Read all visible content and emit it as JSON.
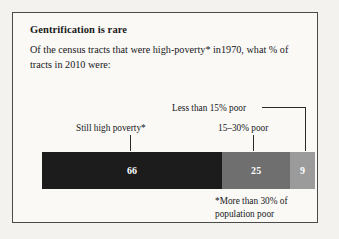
{
  "figure": {
    "title": "Gentrification is rare",
    "subtitle": "Of the census tracts that were high-poverty* in1970, what % of tracts in 2010 were:",
    "footnote": "*More than 30% of population poor",
    "labels": {
      "less_than_15": "Less than 15% poor",
      "fifteen_to_30": "15–30% poor",
      "still_high_poverty": "Still high poverty*"
    },
    "colors": {
      "background": "#f3f2ee",
      "panel": "#faf9f6",
      "border": "#4a4a48",
      "high_poverty": "#1c1c1c",
      "mid_poverty": "#6f6f6f",
      "low_poverty": "#9b9b9b",
      "value_text": "#ffffff",
      "leader_line": "#2a2a2a"
    }
  },
  "chart_data": {
    "type": "bar",
    "orientation": "horizontal-stacked",
    "title": "Gentrification is rare",
    "subtitle": "Of the census tracts that were high-poverty* in1970, what % of tracts in 2010 were:",
    "xlabel": "",
    "ylabel": "",
    "unit": "percent",
    "total": 100,
    "xlim": [
      0,
      100
    ],
    "grid": false,
    "legend_position": "annotations",
    "categories": [
      "Still high poverty*",
      "15–30% poor",
      "Less than 15% poor"
    ],
    "values": [
      66,
      25,
      9
    ],
    "value_labels": [
      "66",
      "25",
      "9"
    ],
    "colors": [
      "#1c1c1c",
      "#6f6f6f",
      "#9b9b9b"
    ],
    "annotations": [
      "*More than 30% of population poor"
    ]
  }
}
